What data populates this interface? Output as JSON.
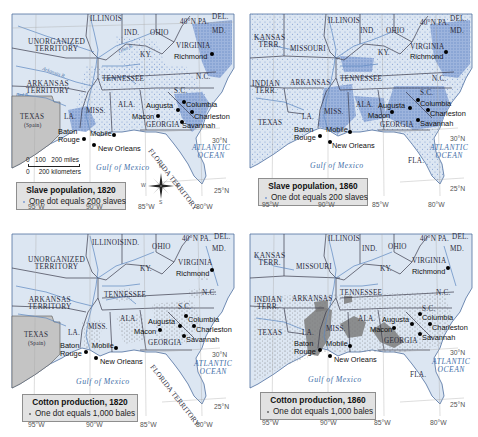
{
  "maps": [
    {
      "id": "slave-1820",
      "legend": {
        "title": "Slave population, 1820",
        "key": "One dot equals 200 slaves"
      },
      "states": {
        "unorganized": "UNORGANIZED\nTERRITORY",
        "illinois": "ILLINOIS",
        "ind": "IND.",
        "ohio": "OHIO",
        "pa": "40°N PA.",
        "del": "DEL.",
        "md": "MD.",
        "virginia": "VIRGINIA",
        "ky": "KY.",
        "tennessee": "TENNESSEE",
        "nc": "N.C.",
        "sc": "S.C.",
        "arkansas": "ARKANSAS\nTERRITORY",
        "miss": "MISS.",
        "ala": "ALA.",
        "georgia": "GEORGIA",
        "la": "LA.",
        "texas": "TEXAS",
        "texas_sub": "(Spain)",
        "florida": "FLORIDA TERRITORY"
      },
      "cities": [
        "Richmond",
        "Augusta",
        "Columbia",
        "Macon",
        "Charleston",
        "Savannah",
        "Baton Rouge",
        "Mobile",
        "New Orleans"
      ],
      "rivers": [
        "Ohio R.",
        "Arkansas R.",
        "Red R.",
        "Cumberland R.",
        "Tennessee R."
      ],
      "water": {
        "gulf": "Gulf of Mexico",
        "atlantic": "ATLANTIC\nOCEAN"
      },
      "scale": {
        "miles": "0   100   200 miles",
        "km": "0     200 kilometers"
      },
      "compass": {
        "n": "N",
        "s": "S",
        "e": "E",
        "w": "W"
      },
      "coords": {
        "lat30": "30°N",
        "lat25": "25°N",
        "lon95": "95°W",
        "lon90": "90°W",
        "lon85": "85°W",
        "lon80": "80°W"
      }
    },
    {
      "id": "slave-1860",
      "legend": {
        "title": "Slave population, 1860",
        "key": "One dot equals 200 slaves"
      },
      "states": {
        "kansas": "KANSAS\nTERR.",
        "missouri": "MISSOURI",
        "illinois": "ILLINOIS",
        "ind": "IND.",
        "ohio": "OHIO",
        "pa": "40°N PA.",
        "del": "DEL.",
        "md": "MD.",
        "virginia": "VIRGINIA",
        "ky": "KY.",
        "indian": "INDIAN\nTERR.",
        "arkansas": "ARKANSAS",
        "tennessee": "TENNESSEE",
        "nc": "N.C.",
        "sc": "S.C.",
        "miss": "MISS.",
        "ala": "ALA.",
        "georgia": "GEORGIA",
        "la": "LA.",
        "texas": "TEXAS",
        "florida": "FLA."
      },
      "cities": [
        "Richmond",
        "Augusta",
        "Columbia",
        "Macon",
        "Charleston",
        "Savannah",
        "Baton Rouge",
        "Mobile",
        "New Orleans"
      ],
      "water": {
        "gulf": "Gulf of Mexico",
        "atlantic": "ATLANTIC\nOCEAN"
      },
      "coords": {
        "lat30": "30°N",
        "lat25": "25°N",
        "lon95": "95°W",
        "lon90": "90°W",
        "lon85": "85°W",
        "lon80": "80°W"
      }
    },
    {
      "id": "cotton-1820",
      "legend": {
        "title": "Cotton production, 1820",
        "key": "One dot equals 1,000 bales"
      },
      "states": {
        "unorganized": "UNORGANIZED\nTERRITORY",
        "illinois": "ILLINOIS",
        "ind": "IND.",
        "ohio": "OHIO",
        "pa": "40°N PA.",
        "del": "DEL.",
        "md": "MD.",
        "virginia": "VIRGINIA",
        "ky": "KY.",
        "tennessee": "TENNESSEE",
        "nc": "N.C.",
        "sc": "S.C.",
        "arkansas": "ARKANSAS\nTERRITORY",
        "miss": "MISS.",
        "ala": "ALA.",
        "georgia": "GEORGIA",
        "la": "LA.",
        "texas": "TEXAS",
        "texas_sub": "(Spain)",
        "florida": "FLORIDA TERRITORY"
      },
      "cities": [
        "Richmond",
        "Augusta",
        "Columbia",
        "Macon",
        "Charleston",
        "Savannah",
        "Baton Rouge",
        "Mobile",
        "New Orleans"
      ],
      "water": {
        "gulf": "Gulf of Mexico",
        "atlantic": "ATLANTIC\nOCEAN"
      },
      "coords": {
        "lat30": "30°N",
        "lat25": "25°N",
        "lon95": "95°W",
        "lon90": "90°W",
        "lon85": "85°W",
        "lon80": "80°W"
      }
    },
    {
      "id": "cotton-1860",
      "legend": {
        "title": "Cotton production, 1860",
        "key": "One dot equals 1,000 bales"
      },
      "states": {
        "kansas": "KANSAS\nTERR.",
        "missouri": "MISSOURI",
        "illinois": "ILLINOIS",
        "ind": "IND.",
        "ohio": "OHIO",
        "pa": "40°N PA.",
        "del": "DEL.",
        "md": "MD.",
        "virginia": "VIRGINIA",
        "ky": "KY.",
        "indian": "INDIAN\nTERR.",
        "arkansas": "ARKANSAS",
        "tennessee": "TENNESSEE",
        "nc": "N.C.",
        "sc": "S.C.",
        "miss": "MISS.",
        "ala": "ALA.",
        "georgia": "GEORGIA",
        "la": "LA.",
        "texas": "TEXAS",
        "florida": "FLA."
      },
      "cities": [
        "Richmond",
        "Augusta",
        "Columbia",
        "Macon",
        "Charleston",
        "Savannah",
        "Baton Rouge",
        "Mobile",
        "New Orleans"
      ],
      "water": {
        "gulf": "Gulf of Mexico",
        "atlantic": "ATLANTIC\nOCEAN"
      },
      "coords": {
        "lat30": "30°N",
        "lat25": "25°N",
        "lon95": "95°W",
        "lon90": "90°W",
        "lon85": "85°W",
        "lon80": "80°W"
      }
    }
  ],
  "colors": {
    "land": "#dce6f2",
    "land_dense_slave": "#8fa9d6",
    "water": "#ffffff",
    "foreign": "#c4c4c4",
    "boundary": "#3b3b4a",
    "river": "#5b86c0",
    "dot_cotton": "#777777",
    "cotton_dense": "#7d7d7d",
    "legend_bg": "#e2e2e2"
  }
}
